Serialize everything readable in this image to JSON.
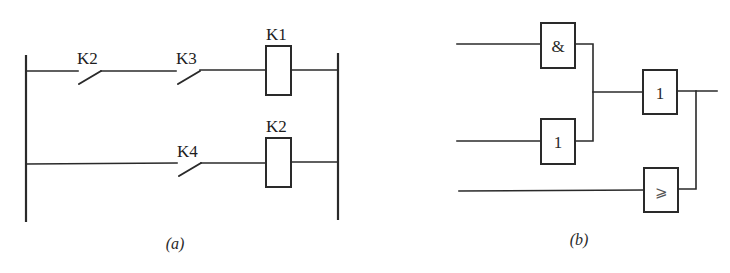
{
  "diagram_a": {
    "caption": "(a)",
    "rungs": [
      {
        "contacts": [
          {
            "label": "K2",
            "type": "normally-open"
          },
          {
            "label": "K3",
            "type": "normally-open"
          }
        ],
        "coil": {
          "label": "K1"
        }
      },
      {
        "contacts": [
          {
            "label": "K4",
            "type": "normally-open"
          }
        ],
        "coil": {
          "label": "K2"
        }
      }
    ]
  },
  "diagram_b": {
    "caption": "(b)",
    "gates": [
      {
        "id": "and",
        "symbol": "&"
      },
      {
        "id": "or_lower",
        "symbol": "1"
      },
      {
        "id": "or_output",
        "symbol": "1"
      },
      {
        "id": "threshold",
        "symbol": "⩾"
      }
    ]
  },
  "colors": {
    "line": "#2a2a2a",
    "background": "#ffffff"
  }
}
